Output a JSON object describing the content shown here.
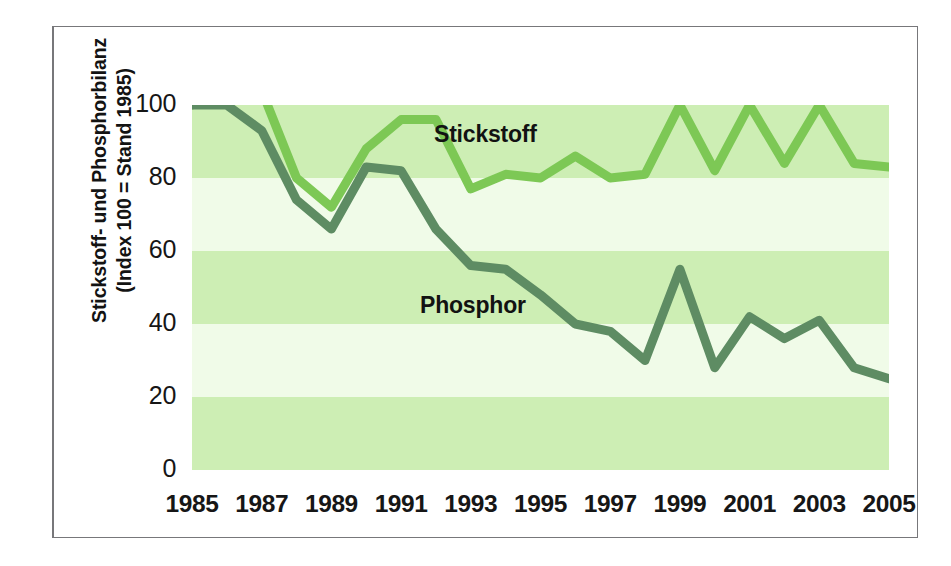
{
  "figure": {
    "y_axis_title_line1": "Stickstoff- und Phosphorbilanz",
    "y_axis_title_line2": "(Index 100 = Stand 1985)",
    "series_label_stickstoff": "Stickstoff",
    "series_label_phosphor": "Phosphor"
  },
  "chart_data": {
    "type": "line",
    "title": "",
    "subtitle": "",
    "xlabel": "",
    "ylabel": "Stickstoff- und Phosphorbilanz (Index 100 = Stand 1985)",
    "xlim": [
      1985,
      2005
    ],
    "ylim": [
      0,
      100
    ],
    "yticks": [
      0,
      20,
      40,
      60,
      80,
      100
    ],
    "ytick_labels": [
      "0",
      "20",
      "40",
      "60",
      "80",
      "100"
    ],
    "xticks": [
      1985,
      1987,
      1989,
      1991,
      1993,
      1995,
      1997,
      1999,
      2001,
      2003,
      2005
    ],
    "xtick_labels": [
      "1985",
      "1987",
      "1989",
      "1991",
      "1993",
      "1995",
      "1997",
      "1999",
      "2001",
      "2003",
      "2005"
    ],
    "grid": false,
    "banded_background": true,
    "band_interval": 20,
    "legend_position": "in-plot-annotations",
    "x": [
      1985,
      1986,
      1987,
      1988,
      1989,
      1990,
      1991,
      1992,
      1993,
      1994,
      1995,
      1996,
      1997,
      1998,
      1999,
      2000,
      2001,
      2002,
      2003,
      2004,
      2005
    ],
    "series": [
      {
        "name": "Stickstoff",
        "color": "#7dc855",
        "values": [
          100,
          108,
          104,
          80,
          72,
          88,
          96,
          96,
          77,
          81,
          80,
          86,
          80,
          81,
          100,
          82,
          100,
          84,
          100,
          84,
          83
        ]
      },
      {
        "name": "Phosphor",
        "color": "#5e8c63",
        "values": [
          100,
          100,
          93,
          74,
          66,
          83,
          82,
          66,
          56,
          55,
          48,
          40,
          38,
          30,
          55,
          28,
          42,
          36,
          41,
          28,
          25
        ]
      }
    ]
  },
  "colors": {
    "stickstoff": "#7dc855",
    "phosphor": "#5e8c63",
    "band_dark": "#cdeeb4",
    "band_light": "#f0fbe8",
    "frame": "#77777a",
    "text": "#161616",
    "background": "#ffffff"
  }
}
